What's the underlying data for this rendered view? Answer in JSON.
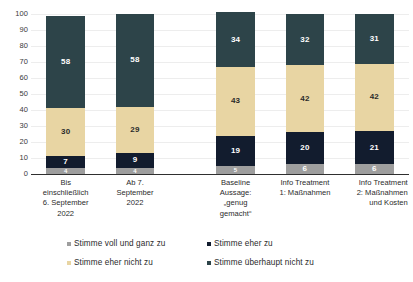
{
  "chart_data": {
    "type": "bar",
    "subtype": "stacked-column-100",
    "title": "",
    "xlabel": "",
    "ylabel": "",
    "ylim": [
      0,
      100
    ],
    "ytick_step": 10,
    "yticks": [
      "100",
      "90",
      "80",
      "70",
      "60",
      "50",
      "40",
      "30",
      "20",
      "10",
      "0"
    ],
    "grid": true,
    "legend_position": "bottom",
    "categories": [
      "Bis einschließlich 6. September 2022",
      "Ab 7. September 2022",
      "Baseline Aussage: „genug gemacht“",
      "Info Treatment 1: Maßnahmen",
      "Info Treatment 2: Maßnahmen und Kosten"
    ],
    "category_lines": [
      [
        "Bis",
        "einschließlich",
        "6. September",
        "2022"
      ],
      [
        "Ab 7.",
        "September",
        "2022"
      ],
      [
        "Baseline",
        "Aussage:",
        "„genug",
        "gemacht“"
      ],
      [
        "Info Treatment",
        "1: Maßnahmen"
      ],
      [
        "Info Treatment",
        "2: Maßnahmen",
        "und Kosten"
      ]
    ],
    "series": [
      {
        "name": "Stimme voll und ganz zu",
        "color": "#9e9e9e",
        "label_color": "#ffffff",
        "values": [
          4,
          4,
          5,
          6,
          6
        ]
      },
      {
        "name": "Stimme eher zu",
        "color": "#121c2e",
        "label_color": "#ffffff",
        "values": [
          7,
          9,
          19,
          20,
          21
        ]
      },
      {
        "name": "Stimme eher nicht zu",
        "color": "#e8d5a3",
        "label_color": "#2b2b2b",
        "values": [
          30,
          29,
          43,
          42,
          42
        ]
      },
      {
        "name": "Stimme überhaupt nicht zu",
        "color": "#2d4449",
        "label_color": "#ffffff",
        "values": [
          58,
          58,
          34,
          32,
          31
        ]
      }
    ],
    "legend_entries": [
      {
        "label": "Stimme voll und ganz zu",
        "color": "#9e9e9e"
      },
      {
        "label": "Stimme eher zu",
        "color": "#121c2e"
      },
      {
        "label": "Stimme eher nicht zu",
        "color": "#e8d5a3"
      },
      {
        "label": "Stimme überhaupt nicht zu",
        "color": "#2d4449"
      }
    ]
  }
}
